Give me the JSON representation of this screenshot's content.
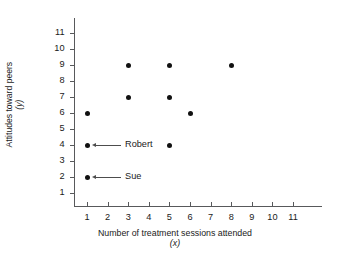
{
  "chart_data": {
    "type": "scatter",
    "title": "",
    "xlabel": "Number of treatment sessions attended",
    "xlabel_sub": "(x)",
    "ylabel": "Attitudes toward peers",
    "ylabel_sub": "(y)",
    "xlim": [
      0,
      11.6
    ],
    "ylim": [
      0,
      11.6
    ],
    "grid": false,
    "legend": "none",
    "xticks": [
      1,
      2,
      3,
      4,
      5,
      6,
      7,
      8,
      9,
      10,
      11
    ],
    "yticks": [
      1,
      2,
      3,
      4,
      5,
      6,
      7,
      8,
      9,
      10,
      11
    ],
    "xticklabels": [
      "1",
      "2",
      "3",
      "4",
      "5",
      "6",
      "7",
      "8",
      "9",
      "10",
      "11"
    ],
    "yticklabels": [
      "1",
      "2",
      "3",
      "4",
      "5",
      "6",
      "7",
      "8",
      "9",
      "10",
      "11"
    ],
    "marker": "filled-circle",
    "marker_color": "#111111",
    "axis_color": "#58595b",
    "points": [
      {
        "x": 1,
        "y": 6
      },
      {
        "x": 1,
        "y": 4
      },
      {
        "x": 1,
        "y": 2
      },
      {
        "x": 3,
        "y": 9
      },
      {
        "x": 3,
        "y": 7
      },
      {
        "x": 5,
        "y": 9
      },
      {
        "x": 5,
        "y": 7
      },
      {
        "x": 5,
        "y": 4
      },
      {
        "x": 6,
        "y": 6
      },
      {
        "x": 8,
        "y": 9
      }
    ],
    "annotations": [
      {
        "label": "Robert",
        "x": 1,
        "y": 4,
        "arrow": "left"
      },
      {
        "label": "Sue",
        "x": 1,
        "y": 2,
        "arrow": "left"
      }
    ]
  }
}
